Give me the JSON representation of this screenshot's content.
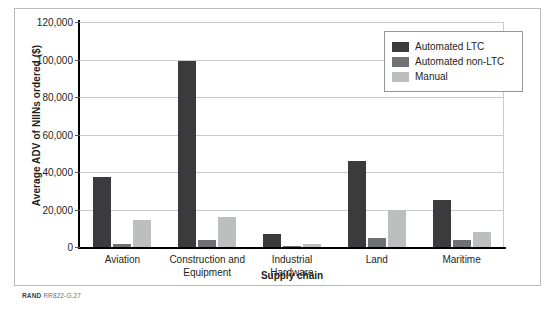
{
  "chart_data": {
    "type": "bar",
    "title": "",
    "xlabel": "Supply chain",
    "ylabel": "Average ADV of NIINs ordered ($)",
    "categories": [
      "Aviation",
      "Construction and Equipment",
      "Industrial Hardware",
      "Land",
      "Maritime"
    ],
    "series": [
      {
        "name": "Automated LTC",
        "color": "#3b3b3d",
        "values": [
          37500,
          99000,
          7000,
          46000,
          25000
        ]
      },
      {
        "name": "Automated non-LTC",
        "color": "#6f7174",
        "values": [
          1500,
          4000,
          300,
          5000,
          3500
        ]
      },
      {
        "name": "Manual",
        "color": "#bcbec0",
        "values": [
          14500,
          16000,
          1500,
          20000,
          8000
        ]
      }
    ],
    "ylim": [
      0,
      120000
    ],
    "ytick_values": [
      0,
      20000,
      40000,
      60000,
      80000,
      100000,
      120000
    ],
    "ytick_labels": [
      "0",
      "20,000",
      "40,000",
      "60,000",
      "80,000",
      "100,000",
      "120,000"
    ],
    "grid": true,
    "legend_position": "top-right"
  },
  "axes": {
    "y_title": "Average ADV of NIINs ordered ($)",
    "x_title": "Supply chain"
  },
  "legend": {
    "items": [
      {
        "label": "Automated LTC"
      },
      {
        "label": "Automated non-LTC"
      },
      {
        "label": "Manual"
      }
    ]
  },
  "footer": {
    "source_prefix": "RAND",
    "source_id": "RR822-G.27"
  }
}
